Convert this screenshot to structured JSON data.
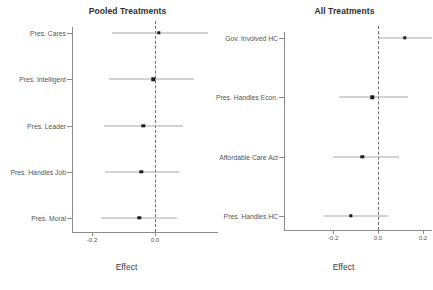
{
  "chart_data": [
    {
      "type": "scatter",
      "title": "Pooled Treatments",
      "xlabel": "Effect",
      "ylabel": "",
      "orientation": "horizontal-dot-ci",
      "grid": false,
      "legend": null,
      "zero_reference_line": 0.0,
      "xlim": [
        -0.27,
        0.2
      ],
      "xticks": [
        -0.2,
        0.0
      ],
      "xticklabels": [
        "-0.2",
        "0.0"
      ],
      "categories": [
        "Pres. Cares",
        "Pres. Intelligent",
        "Pres. Leader",
        "Pres. Handles Job",
        "Pres. Moral"
      ],
      "values": [
        0.012,
        -0.005,
        -0.037,
        -0.043,
        -0.05
      ],
      "ci_low": [
        -0.137,
        -0.145,
        -0.162,
        -0.158,
        -0.17
      ],
      "ci_high": [
        0.168,
        0.123,
        0.09,
        0.076,
        0.07
      ]
    },
    {
      "type": "scatter",
      "title": "All Treatments",
      "xlabel": "Effect",
      "ylabel": "",
      "orientation": "horizontal-dot-ci",
      "grid": false,
      "legend": null,
      "zero_reference_line": 0.0,
      "xlim": [
        -0.28,
        0.24
      ],
      "xticks": [
        -0.2,
        0.0,
        0.2
      ],
      "xticklabels": [
        "-0.2",
        "0.0",
        "0.2"
      ],
      "categories": [
        "Gov. Involved HC",
        "Pres. Handles Econ.",
        "Affordable Care Act",
        "Pres. Handles HC"
      ],
      "values": [
        0.12,
        -0.025,
        -0.07,
        -0.12
      ],
      "ci_low": [
        0.0,
        -0.175,
        -0.2,
        -0.24
      ],
      "ci_high": [
        0.245,
        0.135,
        0.095,
        0.045
      ]
    }
  ],
  "panels": {
    "left": {
      "title": "Pooled Treatments",
      "axis_title": "Effect",
      "ticklabels": [
        "-0.2",
        "0.0"
      ],
      "categories": [
        "Pres. Cares",
        "Pres. Intelligent",
        "Pres. Leader",
        "Pres. Handles Job",
        "Pres. Moral"
      ]
    },
    "right": {
      "title": "All Treatments",
      "axis_title": "Effect",
      "ticklabels": [
        "-0.2",
        "0.0",
        "0.2"
      ],
      "categories": [
        "Gov. Involved HC",
        "Pres. Handles Econ.",
        "Affordable Care Act",
        "Pres. Handles HC"
      ]
    }
  },
  "colors": {
    "point": "#1a1a1a",
    "ci": "#a8a8a8",
    "axis": "#8c8c8c",
    "zeroline": "#6f6f6f",
    "text": "#4d4d4d",
    "background": "#ffffff"
  }
}
